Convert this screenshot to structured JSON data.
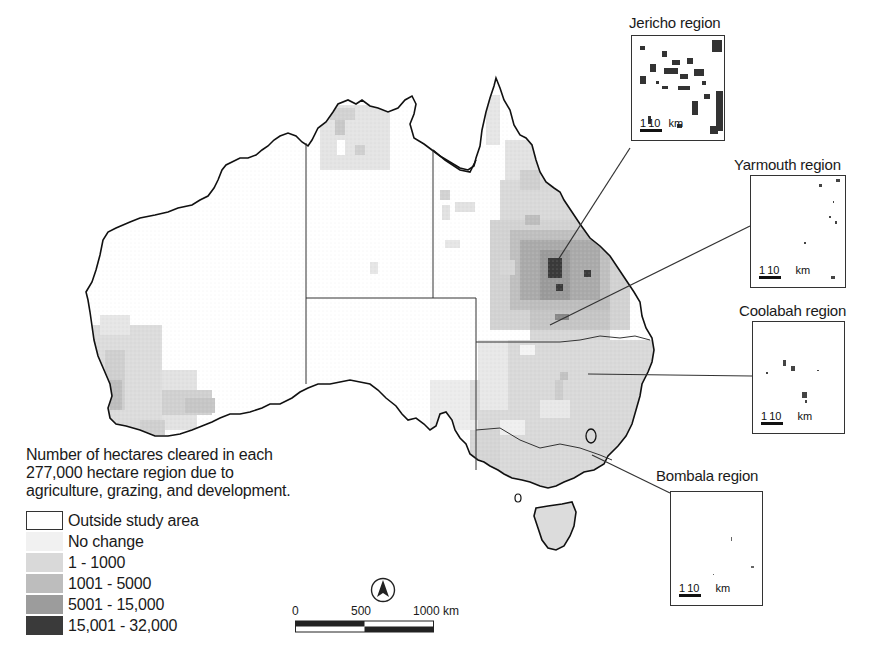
{
  "legend": {
    "title_lines": [
      "Number of hectares cleared in each",
      "277,000 hectare region due to",
      "agriculture, grazing, and development."
    ],
    "items": [
      {
        "label": "Outside study area",
        "color": "#ffffff",
        "border": "#333333"
      },
      {
        "label": "No change",
        "color": "#f1f1f1",
        "border": "none"
      },
      {
        "label": "1 - 1000",
        "color": "#d9d9d9",
        "border": "none"
      },
      {
        "label": "1001 - 5000",
        "color": "#bdbdbd",
        "border": "none"
      },
      {
        "label": "5001 - 15,000",
        "color": "#9c9c9c",
        "border": "none"
      },
      {
        "label": "15,001 - 32,000",
        "color": "#3a3a3a",
        "border": "none"
      }
    ]
  },
  "insets": [
    {
      "name": "Jericho region",
      "scale": {
        "one": "1",
        "ten": "10",
        "unit": "km"
      }
    },
    {
      "name": "Yarmouth region",
      "scale": {
        "one": "1",
        "ten": "10",
        "unit": "km"
      }
    },
    {
      "name": "Coolabah region",
      "scale": {
        "one": "1",
        "ten": "10",
        "unit": "km"
      }
    },
    {
      "name": "Bombala region",
      "scale": {
        "one": "1",
        "ten": "10",
        "unit": "km"
      }
    }
  ],
  "scalebar": {
    "labels": [
      "0",
      "500",
      "1000 km"
    ]
  },
  "north_arrow": {
    "icon": "north-arrow-icon"
  },
  "colors": {
    "outline": "#111111",
    "border": "#333333",
    "no_change": "#f1f1f1",
    "c1": "#d9d9d9",
    "c2": "#bdbdbd",
    "c3": "#9c9c9c",
    "c4": "#3a3a3a"
  }
}
